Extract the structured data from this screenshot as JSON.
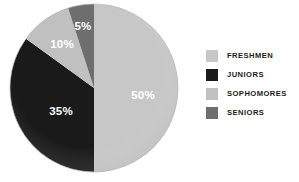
{
  "chart_data": {
    "type": "pie",
    "title": "",
    "subtitle": "",
    "xlabel": "",
    "ylabel": "",
    "grid": false,
    "legend_position": "right",
    "categories": [
      "FRESHMEN",
      "JUNIORS",
      "SOPHOMORES",
      "SENIORS"
    ],
    "values": [
      50,
      35,
      10,
      5
    ],
    "value_labels": [
      "50%",
      "35%",
      "10%",
      "5%"
    ],
    "units": "percent",
    "total": 100,
    "start_angle_deg": 0,
    "direction": "clockwise",
    "colors": [
      "#c7c7c7",
      "#1a1a1a",
      "#c0c0c0",
      "#6e6e6e"
    ],
    "slices": [
      {
        "label": "FRESHMEN",
        "value": 50,
        "value_label": "50%",
        "color": "#c7c7c7",
        "label_color": "#ffffff",
        "start_deg": 0,
        "end_deg": 180,
        "label_x": 135,
        "label_y": 96
      },
      {
        "label": "JUNIORS",
        "value": 35,
        "value_label": "35%",
        "color": "#1a1a1a",
        "label_color": "#ffffff",
        "start_deg": 180,
        "end_deg": 306,
        "label_x": 53,
        "label_y": 112
      },
      {
        "label": "SOPHOMORES",
        "value": 10,
        "value_label": "10%",
        "color": "#c0c0c0",
        "label_color": "#ffffff",
        "start_deg": 306,
        "end_deg": 342,
        "label_x": 54,
        "label_y": 45
      },
      {
        "label": "SENIORS",
        "value": 5,
        "value_label": "5%",
        "color": "#6e6e6e",
        "label_color": "#ffffff",
        "start_deg": 342,
        "end_deg": 360,
        "label_x": 75,
        "label_y": 27
      }
    ]
  },
  "legend": {
    "items": [
      {
        "label": "FRESHMEN",
        "color": "#c7c7c7"
      },
      {
        "label": "JUNIORS",
        "color": "#1a1a1a"
      },
      {
        "label": "SOPHOMORES",
        "color": "#c0c0c0"
      },
      {
        "label": "SENIORS",
        "color": "#6e6e6e"
      }
    ]
  },
  "pie_geometry": {
    "cx": 86,
    "cy": 85,
    "r": 84
  }
}
